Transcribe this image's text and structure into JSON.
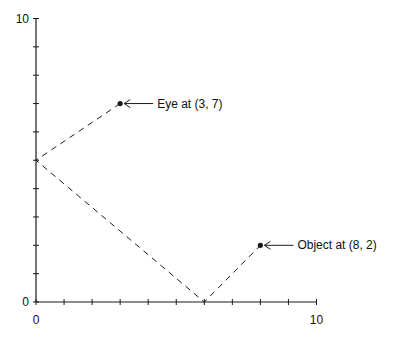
{
  "diagram": {
    "type": "reflection-ray-diagram",
    "axes": {
      "x": {
        "min": 0,
        "max": 10,
        "tick_step": 1,
        "labels": [
          {
            "value": 0,
            "text": "0"
          },
          {
            "value": 10,
            "text": "10"
          }
        ]
      },
      "y": {
        "min": 0,
        "max": 10,
        "tick_step": 1,
        "labels": [
          {
            "value": 0,
            "text": "0"
          },
          {
            "value": 10,
            "text": "10"
          }
        ]
      }
    },
    "points": [
      {
        "id": "eye",
        "x": 3,
        "y": 7,
        "label": "Eye at (3, 7)"
      },
      {
        "id": "object",
        "x": 8,
        "y": 2,
        "label": "Object at (8, 2)"
      }
    ],
    "path": [
      {
        "x": 3,
        "y": 7
      },
      {
        "x": 0,
        "y": 5
      },
      {
        "x": 6,
        "y": 0
      },
      {
        "x": 8,
        "y": 2
      }
    ],
    "colors": {
      "line": "#1a1a1a",
      "background": "#ffffff"
    }
  }
}
